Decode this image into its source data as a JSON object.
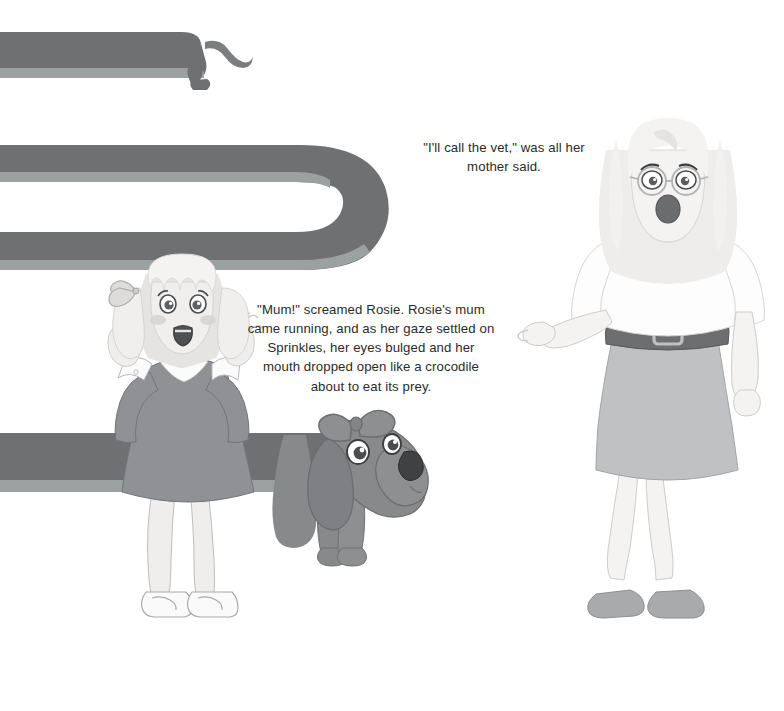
{
  "page": {
    "width": 784,
    "height": 711,
    "background_color": "#ffffff",
    "kind": "picture-book-illustration-page",
    "palette": {
      "body_grey": "#6e7072",
      "body_grey_light": "#8d9092",
      "belly_grey": "#9ba0a1",
      "dog_grey": "#87898b",
      "dog_grey_dark": "#6e7073",
      "dog_nose": "#3f4143",
      "dress_grey": "#8f9194",
      "dress_grey_dark": "#7d7f82",
      "skin": "#f1efee",
      "skin_shade": "#e3e1e0",
      "hair_light": "#efeeec",
      "hair_shade": "#e2e0de",
      "skirt_grey": "#bfc1c2",
      "belt_grey": "#6c6e70",
      "shoe_grey": "#a8aaab",
      "outline": "#9a9c9e",
      "outline_dark": "#5e6063",
      "text_color": "#2b2b2b",
      "cheek": "#d6d2d2",
      "mouth_dark": "#6a6c6e"
    }
  },
  "captions": [
    {
      "id": "caption-mother",
      "speaker": "mother",
      "text": "\"I'll call the vet,\" was all her mother said."
    },
    {
      "id": "caption-rosie",
      "speaker": "narrator",
      "text": "\"Mum!\" screamed Rosie. Rosie's mum came running, and as her gaze settled on Sprinkles, her eyes bulged and her mouth dropped open like a crocodile about to eat its prey."
    }
  ],
  "characters": {
    "dog": {
      "name": "Sprinkles",
      "breed": "dachshund",
      "description": "Extremely long grey dachshund whose body snakes back and forth across the page in three stacked rows",
      "accessory": "bow on head",
      "segments": [
        {
          "row": 1,
          "y": 30,
          "note": "rear body with tail and hind legs, tail curls up at right"
        },
        {
          "row": 2,
          "y": 140,
          "note": "middle body, U-turn bend at right side"
        },
        {
          "row": 3,
          "y": 430,
          "note": "front body passing behind Rosie, head and front legs at right"
        }
      ]
    },
    "girl": {
      "name": "Rosie",
      "expression": "screaming, shocked",
      "hair": "light blonde pigtails with bow",
      "outfit": "grey dress with white collar and white cuffs",
      "shoes": "white strap shoes",
      "pose": "hands raised beside face"
    },
    "mother": {
      "name": "Rosie's mum",
      "expression": "mouth dropped open in shock",
      "hair": "long light blonde",
      "accessories": "round glasses, pearl necklace, wide dark belt with square buckle",
      "outfit": "white top, grey pencil skirt",
      "shoes": "grey flats",
      "pose": "right arm extended pointing left toward the dog"
    }
  }
}
